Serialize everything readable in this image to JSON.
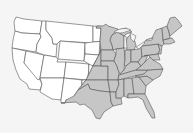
{
  "map": {
    "title": "",
    "region": "Contiguous United States",
    "background": "#f5f5f5",
    "colors": {
      "shaded": "#c6c6c6",
      "unshaded": "#ffffff",
      "border": "#555555"
    },
    "shaded_region": "Eastern United States (east of approx. 100th meridian)",
    "shaded_states": [
      "MN",
      "IA",
      "MO",
      "AR",
      "LA",
      "WI",
      "IL",
      "MI",
      "IN",
      "OH",
      "KY",
      "TN",
      "MS",
      "AL",
      "GA",
      "FL",
      "SC",
      "NC",
      "VA",
      "WV",
      "PA",
      "NY",
      "MD",
      "DE",
      "NJ",
      "CT",
      "RI",
      "MA",
      "VT",
      "NH",
      "ME",
      "DC"
    ],
    "partially_shaded_states": [
      "ND",
      "SD",
      "NE",
      "KS",
      "OK",
      "TX"
    ],
    "unshaded_states": [
      "WA",
      "OR",
      "CA",
      "NV",
      "ID",
      "MT",
      "WY",
      "UT",
      "CO",
      "AZ",
      "NM"
    ]
  }
}
